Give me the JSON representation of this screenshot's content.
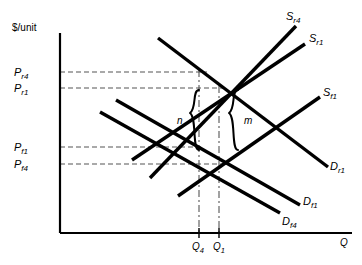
{
  "figure": {
    "type": "economics-supply-demand-diagram",
    "background": "#ffffff",
    "ink": "#000000",
    "guide_color": "#555555",
    "axes": {
      "y_axis_title": "$/unit",
      "x_axis_title": "Q",
      "origin_px": [
        60,
        233
      ],
      "x_axis_end_px": [
        352,
        233
      ],
      "y_axis_top_px": [
        60,
        33
      ]
    },
    "price_labels": [
      {
        "name": "P_r4",
        "base": "P",
        "sub": "r4",
        "y_px": 72,
        "text_x_px": 14
      },
      {
        "name": "P_r1",
        "base": "P",
        "sub": "r1",
        "y_px": 88,
        "text_x_px": 14
      },
      {
        "name": "P_f1",
        "base": "P",
        "sub": "f1",
        "y_px": 147,
        "text_x_px": 14
      },
      {
        "name": "P_f4",
        "base": "P",
        "sub": "f4",
        "y_px": 164,
        "text_x_px": 14
      }
    ],
    "quantity_labels": [
      {
        "name": "Q_4",
        "base": "Q",
        "sub": "4",
        "x_px": 198
      },
      {
        "name": "Q_1",
        "base": "Q",
        "sub": "1",
        "x_px": 219
      }
    ],
    "curves": [
      {
        "id": "Sr4",
        "base": "S",
        "sub": "r4",
        "kind": "supply",
        "x1": 150,
        "y1": 178,
        "x2": 296,
        "y2": 26,
        "label_x": 288,
        "label_y": 17
      },
      {
        "id": "Sr1",
        "base": "S",
        "sub": "r1",
        "kind": "supply",
        "x1": 132,
        "y1": 160,
        "x2": 305,
        "y2": 44,
        "label_x": 310,
        "label_y": 39
      },
      {
        "id": "Sf1",
        "base": "S",
        "sub": "f1",
        "kind": "supply",
        "x1": 178,
        "y1": 196,
        "x2": 320,
        "y2": 97,
        "label_x": 325,
        "label_y": 93
      },
      {
        "id": "Dr1",
        "base": "D",
        "sub": "r1",
        "kind": "demand",
        "x1": 158,
        "y1": 38,
        "x2": 328,
        "y2": 167,
        "label_x": 332,
        "label_y": 167
      },
      {
        "id": "Df1",
        "base": "D",
        "sub": "f1",
        "kind": "demand",
        "x1": 116,
        "y1": 100,
        "x2": 300,
        "y2": 205,
        "label_x": 305,
        "label_y": 201
      },
      {
        "id": "Df4",
        "base": "D",
        "sub": "f4",
        "kind": "demand",
        "x1": 100,
        "y1": 112,
        "x2": 280,
        "y2": 213,
        "label_x": 285,
        "label_y": 221
      }
    ],
    "brace_labels": [
      {
        "id": "n",
        "text": "n",
        "x_px": 182,
        "y_px": 122
      },
      {
        "id": "m",
        "text": "m",
        "x_px": 241,
        "y_px": 122
      }
    ],
    "dashed_price_lines": [
      {
        "for": "P_r4",
        "y_px": 72,
        "x_from": 60,
        "x_to": 205
      },
      {
        "for": "P_r1",
        "y_px": 88,
        "x_from": 60,
        "x_to": 222
      },
      {
        "for": "P_f1",
        "y_px": 147,
        "x_from": 60,
        "x_to": 200
      },
      {
        "for": "P_f4",
        "y_px": 164,
        "x_from": 60,
        "x_to": 222
      }
    ],
    "dashed_quantity_lines": [
      {
        "for": "Q_4",
        "x_px": 199,
        "y_from": 72,
        "y_to": 233
      },
      {
        "for": "Q_1",
        "x_px": 219,
        "y_from": 88,
        "y_to": 233
      }
    ]
  }
}
